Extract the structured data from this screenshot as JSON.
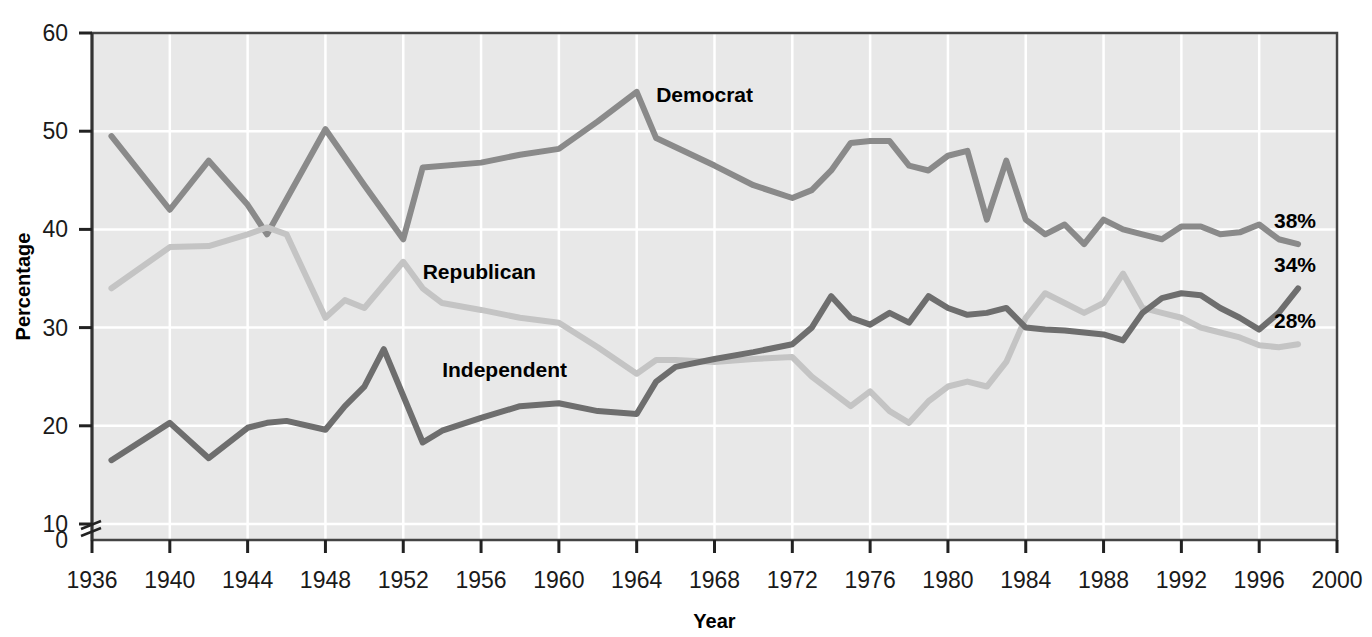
{
  "chart_data": {
    "type": "line",
    "title": "",
    "xlabel": "Year",
    "ylabel": "Percentage",
    "xlim": [
      1936,
      2000
    ],
    "ylim": [
      0,
      60
    ],
    "yticks": [
      0,
      10,
      20,
      30,
      40,
      50,
      60
    ],
    "xticks": [
      1936,
      1940,
      1944,
      1948,
      1952,
      1956,
      1960,
      1964,
      1968,
      1972,
      1976,
      1980,
      1984,
      1988,
      1992,
      1996,
      2000
    ],
    "y_axis_break": true,
    "y_axis_break_between": [
      0,
      10
    ],
    "grid": true,
    "legend": "inline-labels",
    "plot_background": "#e8e8e8",
    "series": [
      {
        "name": "Democrat",
        "color": "#8a8a8a",
        "end_label": "38%",
        "label_x": 1965,
        "label_y": 53,
        "points": [
          [
            1937,
            49.5
          ],
          [
            1940,
            42.0
          ],
          [
            1942,
            47.0
          ],
          [
            1944,
            42.5
          ],
          [
            1945,
            39.5
          ],
          [
            1948,
            50.2
          ],
          [
            1950,
            44.5
          ],
          [
            1952,
            39.0
          ],
          [
            1953,
            46.3
          ],
          [
            1956,
            46.8
          ],
          [
            1958,
            47.6
          ],
          [
            1960,
            48.2
          ],
          [
            1962,
            51.0
          ],
          [
            1964,
            54.0
          ],
          [
            1965,
            49.3
          ],
          [
            1968,
            46.5
          ],
          [
            1970,
            44.5
          ],
          [
            1972,
            43.2
          ],
          [
            1973,
            44.0
          ],
          [
            1974,
            46.0
          ],
          [
            1975,
            48.8
          ],
          [
            1976,
            49.0
          ],
          [
            1977,
            49.0
          ],
          [
            1978,
            46.5
          ],
          [
            1979,
            46.0
          ],
          [
            1980,
            47.5
          ],
          [
            1981,
            48.0
          ],
          [
            1982,
            41.0
          ],
          [
            1983,
            47.0
          ],
          [
            1984,
            41.0
          ],
          [
            1985,
            39.5
          ],
          [
            1986,
            40.5
          ],
          [
            1987,
            38.5
          ],
          [
            1988,
            41.0
          ],
          [
            1989,
            40.0
          ],
          [
            1990,
            39.5
          ],
          [
            1991,
            39.0
          ],
          [
            1992,
            40.3
          ],
          [
            1993,
            40.3
          ],
          [
            1994,
            39.5
          ],
          [
            1995,
            39.7
          ],
          [
            1996,
            40.5
          ],
          [
            1997,
            39.0
          ],
          [
            1998,
            38.5
          ]
        ]
      },
      {
        "name": "Republican",
        "color": "#c4c4c4",
        "end_label": "28%",
        "label_x": 1953,
        "label_y": 35,
        "points": [
          [
            1937,
            34.0
          ],
          [
            1940,
            38.2
          ],
          [
            1942,
            38.3
          ],
          [
            1944,
            39.5
          ],
          [
            1945,
            40.2
          ],
          [
            1946,
            39.5
          ],
          [
            1948,
            31.0
          ],
          [
            1949,
            32.8
          ],
          [
            1950,
            32.0
          ],
          [
            1952,
            36.7
          ],
          [
            1953,
            34.0
          ],
          [
            1954,
            32.5
          ],
          [
            1956,
            31.8
          ],
          [
            1958,
            31.0
          ],
          [
            1960,
            30.5
          ],
          [
            1962,
            28.0
          ],
          [
            1964,
            25.3
          ],
          [
            1965,
            26.7
          ],
          [
            1966,
            26.7
          ],
          [
            1968,
            26.5
          ],
          [
            1970,
            26.8
          ],
          [
            1972,
            27.0
          ],
          [
            1973,
            25.0
          ],
          [
            1974,
            23.5
          ],
          [
            1975,
            22.0
          ],
          [
            1976,
            23.5
          ],
          [
            1977,
            21.5
          ],
          [
            1978,
            20.3
          ],
          [
            1979,
            22.5
          ],
          [
            1980,
            24.0
          ],
          [
            1981,
            24.5
          ],
          [
            1982,
            24.0
          ],
          [
            1983,
            26.5
          ],
          [
            1984,
            31.0
          ],
          [
            1985,
            33.5
          ],
          [
            1986,
            32.5
          ],
          [
            1987,
            31.5
          ],
          [
            1988,
            32.5
          ],
          [
            1989,
            35.5
          ],
          [
            1990,
            32.0
          ],
          [
            1991,
            31.5
          ],
          [
            1992,
            31.0
          ],
          [
            1993,
            30.0
          ],
          [
            1994,
            29.5
          ],
          [
            1995,
            29.0
          ],
          [
            1996,
            28.2
          ],
          [
            1997,
            28.0
          ],
          [
            1998,
            28.3
          ]
        ]
      },
      {
        "name": "Independent",
        "color": "#6e6e6e",
        "end_label": "34%",
        "label_x": 1954,
        "label_y": 25,
        "points": [
          [
            1937,
            16.5
          ],
          [
            1940,
            20.3
          ],
          [
            1942,
            16.7
          ],
          [
            1944,
            19.8
          ],
          [
            1945,
            20.3
          ],
          [
            1946,
            20.5
          ],
          [
            1948,
            19.6
          ],
          [
            1949,
            22.0
          ],
          [
            1950,
            24.0
          ],
          [
            1951,
            27.8
          ],
          [
            1953,
            18.3
          ],
          [
            1954,
            19.5
          ],
          [
            1956,
            20.8
          ],
          [
            1958,
            22.0
          ],
          [
            1960,
            22.3
          ],
          [
            1962,
            21.5
          ],
          [
            1964,
            21.2
          ],
          [
            1965,
            24.5
          ],
          [
            1966,
            26.0
          ],
          [
            1968,
            26.8
          ],
          [
            1970,
            27.5
          ],
          [
            1972,
            28.3
          ],
          [
            1973,
            30.0
          ],
          [
            1974,
            33.2
          ],
          [
            1975,
            31.0
          ],
          [
            1976,
            30.3
          ],
          [
            1977,
            31.5
          ],
          [
            1978,
            30.5
          ],
          [
            1979,
            33.2
          ],
          [
            1980,
            32.0
          ],
          [
            1981,
            31.3
          ],
          [
            1982,
            31.5
          ],
          [
            1983,
            32.0
          ],
          [
            1984,
            30.0
          ],
          [
            1985,
            29.8
          ],
          [
            1986,
            29.7
          ],
          [
            1987,
            29.5
          ],
          [
            1988,
            29.3
          ],
          [
            1989,
            28.7
          ],
          [
            1990,
            31.5
          ],
          [
            1991,
            33.0
          ],
          [
            1992,
            33.5
          ],
          [
            1993,
            33.3
          ],
          [
            1994,
            32.0
          ],
          [
            1995,
            31.0
          ],
          [
            1996,
            29.8
          ],
          [
            1997,
            31.5
          ],
          [
            1998,
            34.0
          ]
        ]
      }
    ]
  }
}
